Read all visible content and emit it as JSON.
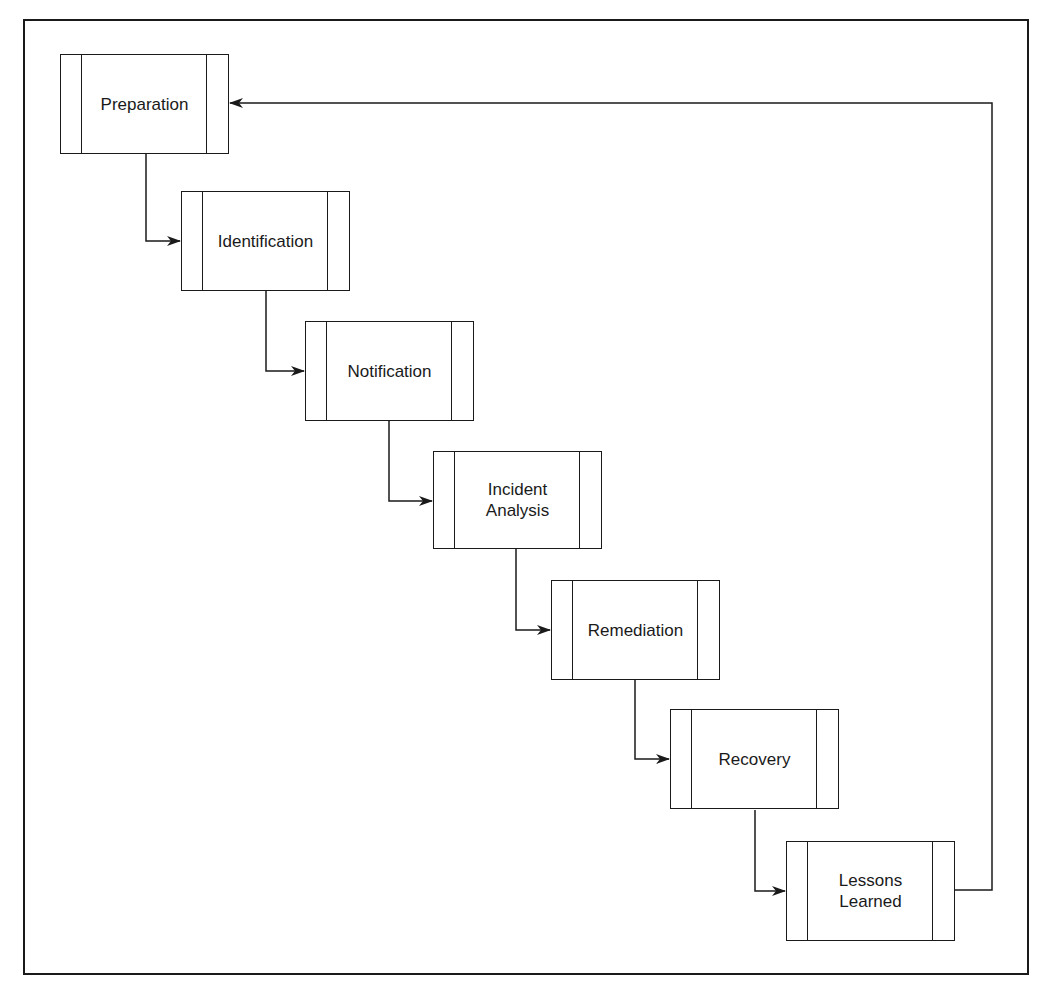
{
  "diagram": {
    "type": "flowchart",
    "colors": {
      "stroke": "#1a1a1a",
      "background": "#ffffff"
    },
    "nodes": [
      {
        "id": "preparation",
        "label": "Preparation",
        "x": 60,
        "y": 54
      },
      {
        "id": "identification",
        "label": "Identification",
        "x": 181,
        "y": 191
      },
      {
        "id": "notification",
        "label": "Notification",
        "x": 305,
        "y": 321
      },
      {
        "id": "incident-analysis",
        "label": "Incident\nAnalysis",
        "x": 433,
        "y": 451
      },
      {
        "id": "remediation",
        "label": "Remediation",
        "x": 551,
        "y": 580
      },
      {
        "id": "recovery",
        "label": "Recovery",
        "x": 670,
        "y": 709
      },
      {
        "id": "lessons-learned",
        "label": "Lessons\nLearned",
        "x": 786,
        "y": 841
      }
    ],
    "edges": [
      {
        "from": "preparation",
        "to": "identification"
      },
      {
        "from": "identification",
        "to": "notification"
      },
      {
        "from": "notification",
        "to": "incident-analysis"
      },
      {
        "from": "incident-analysis",
        "to": "remediation"
      },
      {
        "from": "remediation",
        "to": "recovery"
      },
      {
        "from": "recovery",
        "to": "lessons-learned"
      },
      {
        "from": "lessons-learned",
        "to": "preparation",
        "kind": "feedback-loop"
      }
    ]
  }
}
